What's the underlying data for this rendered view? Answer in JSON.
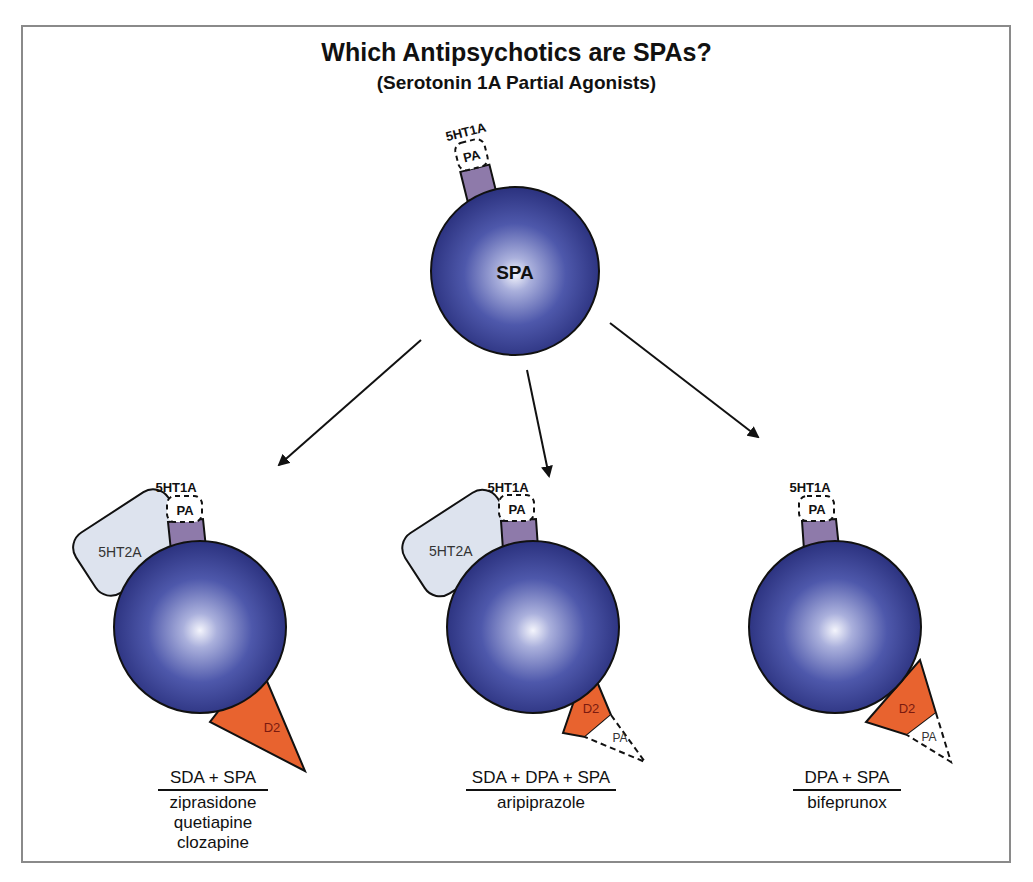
{
  "title": "Which Antipsychotics are SPAs?",
  "subtitle": "(Serotonin 1A Partial Agonists)",
  "colors": {
    "ball_dark": "#2b3180",
    "ball_mid": "#4a54a8",
    "ball_highlight": "#eef0fb",
    "receptor_5ht1a": "#8e7aaa",
    "receptor_5ht2a": "#dde3ee",
    "receptor_d2": "#e8632f",
    "frame": "#8a8a8a"
  },
  "top": {
    "ball_label": "SPA",
    "receptor_label": "5HT1A",
    "pa_label": "PA"
  },
  "left": {
    "receptor_5ht1a": "5HT1A",
    "pa_label": "PA",
    "receptor_5ht2a": "5HT2A",
    "receptor_d2": "D2",
    "caption_head": "SDA + SPA",
    "drugs": [
      "ziprasidone",
      "quetiapine",
      "clozapine"
    ]
  },
  "middle": {
    "receptor_5ht1a": "5HT1A",
    "pa_label": "PA",
    "receptor_5ht2a": "5HT2A",
    "receptor_d2": "D2",
    "d2_pa_label": "PA",
    "caption_head": "SDA + DPA + SPA",
    "drugs": [
      "aripiprazole"
    ]
  },
  "right": {
    "receptor_5ht1a": "5HT1A",
    "pa_label": "PA",
    "receptor_d2": "D2",
    "d2_pa_label": "PA",
    "caption_head": "DPA + SPA",
    "drugs": [
      "bifeprunox"
    ]
  }
}
